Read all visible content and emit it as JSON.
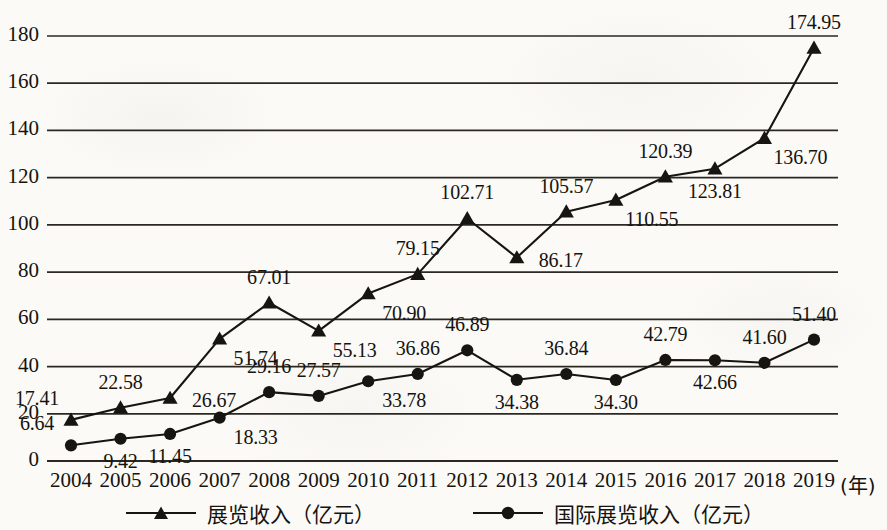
{
  "chart_data": {
    "type": "line",
    "title": "",
    "subtitle": "",
    "xlabel": "(年)",
    "ylabel": "",
    "xlim_categories": [
      "2004",
      "2005",
      "2006",
      "2007",
      "2008",
      "2009",
      "2010",
      "2011",
      "2012",
      "2013",
      "2014",
      "2015",
      "2016",
      "2017",
      "2018",
      "2019"
    ],
    "ylim": [
      0,
      180
    ],
    "ytick_step": 20,
    "yticks": [
      "0",
      "20",
      "40",
      "60",
      "80",
      "100",
      "120",
      "140",
      "160",
      "180"
    ],
    "grid": "horizontal",
    "legend_position": "bottom",
    "categories": [
      "2004",
      "2005",
      "2006",
      "2007",
      "2008",
      "2009",
      "2010",
      "2011",
      "2012",
      "2013",
      "2014",
      "2015",
      "2016",
      "2017",
      "2018",
      "2019"
    ],
    "series": [
      {
        "name": "展览收入（亿元）",
        "marker": "triangle",
        "color": "#17150f",
        "values": [
          17.41,
          22.58,
          26.67,
          51.74,
          67.01,
          55.13,
          70.9,
          79.15,
          102.71,
          86.17,
          105.57,
          110.55,
          120.39,
          123.81,
          136.7,
          174.95
        ],
        "labels": [
          "17.41",
          "22.58",
          "26.67",
          "51.74",
          "67.01",
          "55.13",
          "70.90",
          "79.15",
          "102.71",
          "86.17",
          "105.57",
          "110.55",
          "120.39",
          "123.81",
          "136.70",
          "174.95"
        ],
        "label_positions": [
          "above-left",
          "above",
          "right",
          "below-right",
          "above",
          "below-right",
          "below-right",
          "above",
          "above",
          "right",
          "above",
          "below-right",
          "above",
          "below",
          "below-right",
          "above"
        ]
      },
      {
        "name": "国际展览收入（亿元）",
        "marker": "circle",
        "color": "#17150f",
        "values": [
          6.64,
          9.42,
          11.45,
          18.33,
          29.16,
          27.57,
          33.78,
          36.86,
          46.89,
          34.38,
          36.84,
          34.3,
          42.79,
          42.66,
          41.6,
          51.4
        ],
        "labels": [
          "6.64",
          "9.42",
          "11.45",
          "18.33",
          "29.16",
          "27.57",
          "33.78",
          "36.86",
          "46.89",
          "34.38",
          "36.84",
          "34.30",
          "42.79",
          "42.66",
          "41.60",
          "51.40"
        ],
        "label_positions": [
          "above-left",
          "below",
          "below",
          "below-right",
          "above",
          "above",
          "below-right",
          "above",
          "above",
          "below",
          "above",
          "below",
          "above",
          "below",
          "above",
          "above"
        ]
      }
    ]
  },
  "axis": {
    "x_unit_label": "(年)",
    "y_tick_labels": [
      "180",
      "160",
      "140",
      "120",
      "100",
      "80",
      "60",
      "40",
      "20",
      "0"
    ]
  },
  "legend": {
    "items": [
      {
        "label": "展览收入（亿元）",
        "marker": "triangle-marker-icon"
      },
      {
        "label": "国际展览收入（亿元）",
        "marker": "circle-marker-icon"
      }
    ]
  }
}
